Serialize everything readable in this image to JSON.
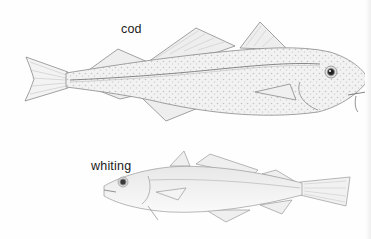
{
  "illustration": {
    "style": "pencil drawing",
    "background": "#ffffff",
    "line_color": "#8a8a8a",
    "fish": [
      {
        "label": "cod",
        "facing": "right"
      },
      {
        "label": "whiting",
        "facing": "left"
      }
    ]
  }
}
